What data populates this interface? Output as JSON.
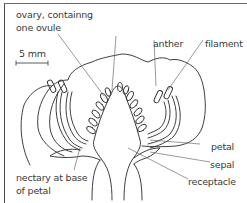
{
  "diagram": {
    "scale_bar": {
      "label": "5 mm"
    },
    "labels": {
      "ovary": [
        "ovary, containng",
        "one ovule"
      ],
      "anther": "anther",
      "filament": "filament",
      "nectary": [
        "nectary at base",
        "of petal"
      ],
      "petal": "petal",
      "sepal": "sepal",
      "receptacle": "receptacle"
    },
    "colors": {
      "line": "#2a2a2a",
      "leader": "#555555",
      "text": "#3a3a3a",
      "border": "#4a4a4a"
    }
  }
}
